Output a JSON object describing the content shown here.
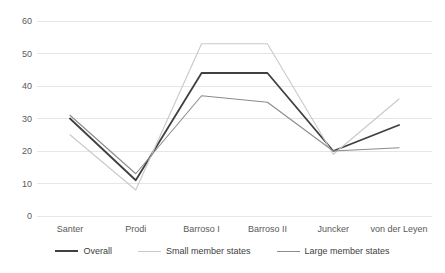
{
  "chart_data": {
    "type": "line",
    "title": "",
    "xlabel": "",
    "ylabel": "",
    "categories": [
      "Santer",
      "Prodi",
      "Barroso I",
      "Barroso II",
      "Juncker",
      "von der Leyen"
    ],
    "ylim": [
      0,
      60
    ],
    "yticks": [
      0,
      10,
      20,
      30,
      40,
      50,
      60
    ],
    "grid": true,
    "legend_position": "bottom",
    "series": [
      {
        "name": "Overall",
        "color": "#404040",
        "width": 1.8,
        "values": [
          30,
          11,
          44,
          44,
          20,
          28
        ]
      },
      {
        "name": "Small member states",
        "color": "#c9c9c9",
        "width": 1.1,
        "values": [
          25,
          8,
          53,
          53,
          19,
          36
        ]
      },
      {
        "name": "Large member states",
        "color": "#8c8c8c",
        "width": 1.1,
        "values": [
          31,
          13,
          37,
          35,
          20,
          21
        ]
      }
    ]
  },
  "axis": {
    "y_tick_labels": [
      "60",
      "50",
      "40",
      "30",
      "20",
      "10",
      "0"
    ],
    "x_tick_labels": [
      "Santer",
      "Prodi",
      "Barroso I",
      "Barroso II",
      "Juncker",
      "von der Leyen"
    ]
  },
  "legend": {
    "entries": [
      {
        "label": "Overall"
      },
      {
        "label": "Small member states"
      },
      {
        "label": "Large member states"
      }
    ]
  },
  "colors": {
    "overall": "#404040",
    "small": "#c9c9c9",
    "large": "#8c8c8c",
    "grid": "#e6e6e6",
    "tick_text": "#595959"
  }
}
